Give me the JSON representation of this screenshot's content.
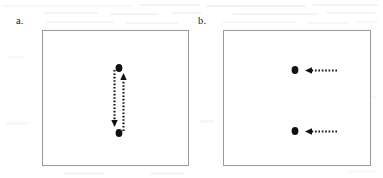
{
  "figure": {
    "caption_labels": {
      "panel_a": "a.",
      "panel_b": "b."
    },
    "background_color": "#ffffff",
    "ink_color": "#111111",
    "panel_border_color": "#9a9a9c",
    "bleed_through_color": "#c9c9cb"
  },
  "panels": [
    {
      "id": "a",
      "label": "a.",
      "label_x": 16,
      "label_y": 16,
      "box": {
        "x": 42,
        "y": 30,
        "w": 147,
        "h": 136
      },
      "description": "Two vertical dotted arrows forming a closed up-down loop between two dots",
      "dots": [
        {
          "name": "top-dot",
          "cx": 119,
          "cy": 68,
          "rx": 3.4,
          "ry": 3.9
        },
        {
          "name": "bottom-dot",
          "cx": 119,
          "cy": 133,
          "rx": 3.4,
          "ry": 3.9
        }
      ],
      "arrows": [
        {
          "name": "down-arrow",
          "orientation": "vertical",
          "direction": "down",
          "x": 114.5,
          "y_start": 70,
          "y_end": 127,
          "head_at": "end"
        },
        {
          "name": "up-arrow",
          "orientation": "vertical",
          "direction": "up",
          "x": 123.5,
          "y_start": 131,
          "y_end": 73,
          "head_at": "end"
        }
      ]
    },
    {
      "id": "b",
      "label": "b.",
      "label_x": 198,
      "label_y": 16,
      "box": {
        "x": 223,
        "y": 30,
        "w": 148,
        "h": 136
      },
      "description": "Two dots each approached from the right by a horizontal dotted left-pointing arrow",
      "dots": [
        {
          "name": "upper-dot",
          "cx": 295,
          "cy": 70,
          "rx": 3.4,
          "ry": 3.9
        },
        {
          "name": "lower-dot",
          "cx": 295,
          "cy": 131,
          "rx": 3.4,
          "ry": 3.9
        }
      ],
      "arrows": [
        {
          "name": "upper-left-arrow",
          "orientation": "horizontal",
          "direction": "left",
          "y": 70.5,
          "x_start": 337,
          "x_end": 305,
          "head_at": "end"
        },
        {
          "name": "lower-left-arrow",
          "orientation": "horizontal",
          "direction": "left",
          "y": 131.5,
          "x_start": 337,
          "x_end": 305,
          "head_at": "end"
        }
      ]
    }
  ],
  "scan_artifacts": {
    "note": "faint grey reverse-side bleed-through text along the top margin",
    "lines": [
      {
        "x": 2,
        "y": 5,
        "w": 130,
        "h": 2
      },
      {
        "x": 140,
        "y": 4,
        "w": 60,
        "h": 2
      },
      {
        "x": 206,
        "y": 5,
        "w": 100,
        "h": 2
      },
      {
        "x": 312,
        "y": 4,
        "w": 66,
        "h": 2
      },
      {
        "x": 44,
        "y": 12,
        "w": 54,
        "h": 2
      },
      {
        "x": 110,
        "y": 13,
        "w": 48,
        "h": 2
      },
      {
        "x": 172,
        "y": 12,
        "w": 30,
        "h": 2
      },
      {
        "x": 232,
        "y": 13,
        "w": 86,
        "h": 2
      },
      {
        "x": 326,
        "y": 12,
        "w": 50,
        "h": 2
      },
      {
        "x": 46,
        "y": 21,
        "w": 68,
        "h": 2
      },
      {
        "x": 126,
        "y": 22,
        "w": 52,
        "h": 2
      },
      {
        "x": 222,
        "y": 21,
        "w": 74,
        "h": 2
      },
      {
        "x": 306,
        "y": 22,
        "w": 44,
        "h": 2
      },
      {
        "x": 356,
        "y": 21,
        "w": 22,
        "h": 2
      }
    ],
    "blobs": [
      {
        "x": 8,
        "y": 56,
        "w": 16,
        "h": 3
      },
      {
        "x": 6,
        "y": 122,
        "w": 22,
        "h": 3
      },
      {
        "x": 200,
        "y": 120,
        "w": 14,
        "h": 3
      },
      {
        "x": 352,
        "y": 96,
        "w": 24,
        "h": 3
      },
      {
        "x": 348,
        "y": 170,
        "w": 28,
        "h": 3
      },
      {
        "x": 64,
        "y": 172,
        "w": 40,
        "h": 3
      },
      {
        "x": 150,
        "y": 172,
        "w": 34,
        "h": 3
      }
    ]
  }
}
